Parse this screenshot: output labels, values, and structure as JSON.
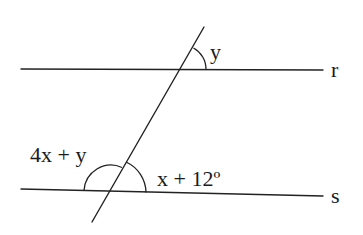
{
  "diagram": {
    "type": "parallel-lines-transversal",
    "lines": {
      "r": {
        "label": "r"
      },
      "s": {
        "label": "s"
      }
    },
    "angles": {
      "top_angle": {
        "label": "y"
      },
      "bottom_left_angle": {
        "label": "4x + y"
      },
      "bottom_right_angle": {
        "label": "x + 12º"
      }
    },
    "colors": {
      "stroke": "#222222",
      "background": "#ffffff"
    }
  }
}
